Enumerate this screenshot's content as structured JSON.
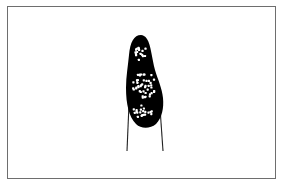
{
  "figure": {
    "colors": {
      "frame": "#6e6e6e",
      "body": "#000000",
      "granules": "#ffffff",
      "background": "#ffffff"
    },
    "clusters": [
      {
        "name": "upper",
        "cx": 140,
        "cy": 52,
        "count": 16
      },
      {
        "name": "middle",
        "cx": 144,
        "cy": 85,
        "count": 45
      },
      {
        "name": "lower",
        "cx": 143,
        "cy": 111,
        "count": 20
      }
    ]
  }
}
